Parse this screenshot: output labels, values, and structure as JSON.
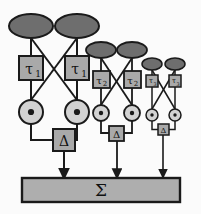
{
  "figure": {
    "background_color": "#fbfbfb"
  },
  "palette": {
    "ellipse_fill": "#6e6e6e",
    "box_fill": "#a9a9a9",
    "circle_fill": "#d2d2d2",
    "bar_fill": "#aeaeae",
    "stroke": "#1a1a1a",
    "text": "#111111"
  },
  "summation": {
    "symbol": "Σ",
    "name": "summation-bar",
    "x": 22,
    "y": 178,
    "width": 158,
    "height": 24
  },
  "modules": [
    {
      "id": "module-1",
      "scale": "large",
      "tau_label": "τ",
      "tau_subscript": "1",
      "delta_label": "Δ",
      "product_symbol": "⊙",
      "inputs": 2,
      "nodes": {
        "ellipses": [
          {
            "cx": 31,
            "cy": 26,
            "rx": 22,
            "ry": 12
          },
          {
            "cx": 77,
            "cy": 26,
            "rx": 22,
            "ry": 12
          }
        ],
        "tau_boxes": [
          {
            "x": 19,
            "y": 56,
            "w": 24,
            "h": 24
          },
          {
            "x": 65,
            "y": 56,
            "w": 24,
            "h": 24
          }
        ],
        "circles": [
          {
            "cx": 31,
            "cy": 112,
            "r": 12
          },
          {
            "cx": 77,
            "cy": 112,
            "r": 12
          }
        ],
        "delta_box": {
          "x": 53,
          "y": 129,
          "w": 22,
          "h": 22
        },
        "output_arrow_x": 64
      }
    },
    {
      "id": "module-2",
      "scale": "medium",
      "tau_label": "τ",
      "tau_subscript": "2",
      "delta_label": "Δ",
      "product_symbol": "⊙",
      "inputs": 2,
      "nodes": {
        "ellipses": [
          {
            "cx": 101,
            "cy": 50,
            "rx": 15,
            "ry": 8
          },
          {
            "cx": 132,
            "cy": 50,
            "rx": 15,
            "ry": 8
          }
        ],
        "tau_boxes": [
          {
            "x": 93,
            "y": 71,
            "w": 17,
            "h": 17
          },
          {
            "x": 124,
            "y": 71,
            "w": 17,
            "h": 17
          }
        ],
        "circles": [
          {
            "cx": 101,
            "cy": 113,
            "r": 8
          },
          {
            "cx": 132,
            "cy": 113,
            "r": 8
          }
        ],
        "delta_box": {
          "x": 109,
          "y": 126,
          "w": 15,
          "h": 15
        },
        "output_arrow_x": 117
      }
    },
    {
      "id": "module-3",
      "scale": "small",
      "tau_label": "τ",
      "tau_subscript": "3",
      "delta_label": "Δ",
      "product_symbol": "⊙",
      "inputs": 2,
      "nodes": {
        "ellipses": [
          {
            "cx": 152,
            "cy": 64,
            "rx": 10,
            "ry": 6
          },
          {
            "cx": 175,
            "cy": 64,
            "rx": 10,
            "ry": 6
          }
        ],
        "tau_boxes": [
          {
            "x": 146,
            "y": 75,
            "w": 12,
            "h": 12
          },
          {
            "x": 169,
            "y": 75,
            "w": 12,
            "h": 12
          }
        ],
        "circles": [
          {
            "cx": 152,
            "cy": 115,
            "r": 6
          },
          {
            "cx": 175,
            "cy": 115,
            "r": 6
          }
        ],
        "delta_box": {
          "x": 158,
          "y": 124,
          "w": 11,
          "h": 11
        },
        "output_arrow_x": 163
      }
    }
  ],
  "legend": {
    "ellipse_meaning": "input-sensor-node",
    "tau_meaning": "delay-element",
    "circle_meaning": "multiplication-node",
    "delta_meaning": "difference-element",
    "sigma_meaning": "summation-node"
  }
}
